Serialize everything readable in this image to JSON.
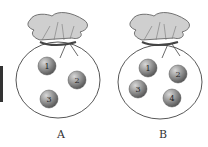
{
  "figure": {
    "bags": [
      {
        "label": "A",
        "balls": [
          {
            "number": "1"
          },
          {
            "number": "2"
          },
          {
            "number": "3"
          }
        ]
      },
      {
        "label": "B",
        "balls": [
          {
            "number": "1"
          },
          {
            "number": "2"
          },
          {
            "number": "3"
          },
          {
            "number": "4"
          }
        ]
      }
    ],
    "colors": {
      "ball_fill": "#8a8a8a",
      "ball_highlight": "#d0d0d0",
      "bag_stroke": "#444444",
      "bag_top_fill": "#c8c8c8",
      "left_bar": "#333333"
    }
  }
}
